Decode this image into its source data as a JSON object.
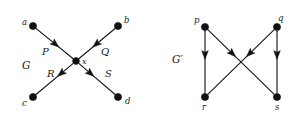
{
  "figure": {
    "background_color": "#ffffff",
    "ink_color": "#111111",
    "width": 300,
    "height": 120
  },
  "graphs": [
    {
      "id": "G",
      "name": "graph-G",
      "label": "G",
      "label_position": {
        "x": 22,
        "y": 60
      },
      "description": "Directed star graph with central vertex x, two incoming edges P and Q, and two outgoing edges R and S.",
      "nodes": [
        {
          "id": "a",
          "label": "a",
          "x": 33,
          "y": 26,
          "label_x": 22,
          "label_y": 18,
          "radius": 3.6
        },
        {
          "id": "b",
          "label": "b",
          "x": 118,
          "y": 26,
          "label_x": 124,
          "label_y": 16,
          "radius": 3.6
        },
        {
          "id": "c",
          "label": "c",
          "x": 33,
          "y": 97,
          "label_x": 22,
          "label_y": 99,
          "radius": 3.6
        },
        {
          "id": "d",
          "label": "d",
          "x": 118,
          "y": 97,
          "label_x": 125,
          "label_y": 97,
          "radius": 3.6
        },
        {
          "id": "x",
          "label": "x",
          "x": 76,
          "y": 61,
          "label_x": 82,
          "label_y": 58,
          "radius": 3.4
        }
      ],
      "edges": [
        {
          "id": "P",
          "label": "P",
          "from": "a",
          "to": "x",
          "label_x": 42,
          "label_y": 47,
          "arrow_t": 0.62
        },
        {
          "id": "Q",
          "label": "Q",
          "from": "b",
          "to": "x",
          "label_x": 101,
          "label_y": 47,
          "arrow_t": 0.62
        },
        {
          "id": "R",
          "label": "R",
          "from": "x",
          "to": "c",
          "label_x": 47,
          "label_y": 69,
          "arrow_t": 0.42
        },
        {
          "id": "S",
          "label": "S",
          "from": "x",
          "to": "d",
          "label_x": 105,
          "label_y": 69,
          "arrow_t": 0.42
        }
      ]
    },
    {
      "id": "Gprime",
      "name": "graph-G-prime",
      "label": "G′",
      "label_position": {
        "x": 172,
        "y": 54
      },
      "description": "Directed graph on four vertices p, q, r, s with crossing edges; p and q are sources, r and s are sinks.",
      "nodes": [
        {
          "id": "p",
          "label": "p",
          "x": 205,
          "y": 27,
          "label_x": 194,
          "label_y": 16,
          "radius": 3.6
        },
        {
          "id": "q",
          "label": "q",
          "x": 277,
          "y": 27,
          "label_x": 278,
          "label_y": 14,
          "radius": 3.6
        },
        {
          "id": "r",
          "label": "r",
          "x": 205,
          "y": 97,
          "label_x": 202,
          "label_y": 103,
          "radius": 3.6
        },
        {
          "id": "s",
          "label": "s",
          "x": 277,
          "y": 97,
          "label_x": 275,
          "label_y": 103,
          "radius": 3.6
        }
      ],
      "edges": [
        {
          "id": "pr",
          "label": "",
          "from": "p",
          "to": "r",
          "arrow_t": 0.46
        },
        {
          "id": "ps",
          "label": "",
          "from": "p",
          "to": "s",
          "arrow_t": 0.42
        },
        {
          "id": "qs",
          "label": "",
          "from": "q",
          "to": "s",
          "arrow_t": 0.46
        },
        {
          "id": "qr",
          "label": "",
          "from": "q",
          "to": "r",
          "arrow_t": 0.42
        }
      ]
    }
  ]
}
